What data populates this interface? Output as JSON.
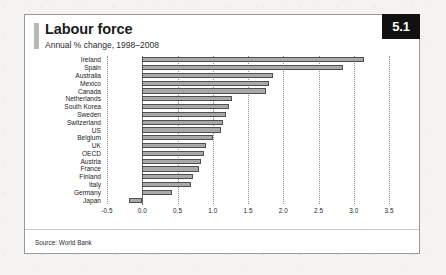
{
  "card": {
    "badge": "5.1",
    "title": "Labour force",
    "subtitle": "Annual % change, 1998–2008",
    "source": "Source: World Bank"
  },
  "colors": {
    "bar_fill": "#a9a9a9",
    "bar_border": "#4f4f4f",
    "badge_bg": "#111111",
    "badge_text": "#ffffff",
    "accent": "#b9b9b7",
    "card_bg": "#ffffff",
    "page_bg": "#f4f3f1",
    "grid": "#8f8f8f",
    "axis": "#6d6d6d"
  },
  "chart_data": {
    "type": "bar",
    "orientation": "horizontal",
    "title": "Labour force",
    "subtitle": "Annual % change, 1998–2008",
    "xlabel": "",
    "ylabel": "",
    "xlim": [
      -0.5,
      3.5
    ],
    "xticks": [
      -0.5,
      0.0,
      0.5,
      1.0,
      1.5,
      2.0,
      2.5,
      3.0,
      3.5
    ],
    "xticklabels": [
      "-0.5",
      "0.0",
      "0.5",
      "1.0",
      "1.5",
      "2.0",
      "2.5",
      "3.0",
      "3.5"
    ],
    "grid": true,
    "grid_axis": "x",
    "legend": false,
    "sorted": "descending",
    "categories": [
      "Ireland",
      "Spain",
      "Australia",
      "Mexico",
      "Canada",
      "Netherlands",
      "South Korea",
      "Sweden",
      "Switzerland",
      "US",
      "Belgium",
      "UK",
      "OECD",
      "Austria",
      "France",
      "Finland",
      "Italy",
      "Germany",
      "Japan"
    ],
    "values": [
      3.15,
      2.85,
      1.85,
      1.8,
      1.75,
      1.28,
      1.23,
      1.19,
      1.15,
      1.12,
      1.0,
      0.91,
      0.87,
      0.83,
      0.81,
      0.72,
      0.69,
      0.42,
      -0.19
    ],
    "source": "Source: World Bank"
  }
}
